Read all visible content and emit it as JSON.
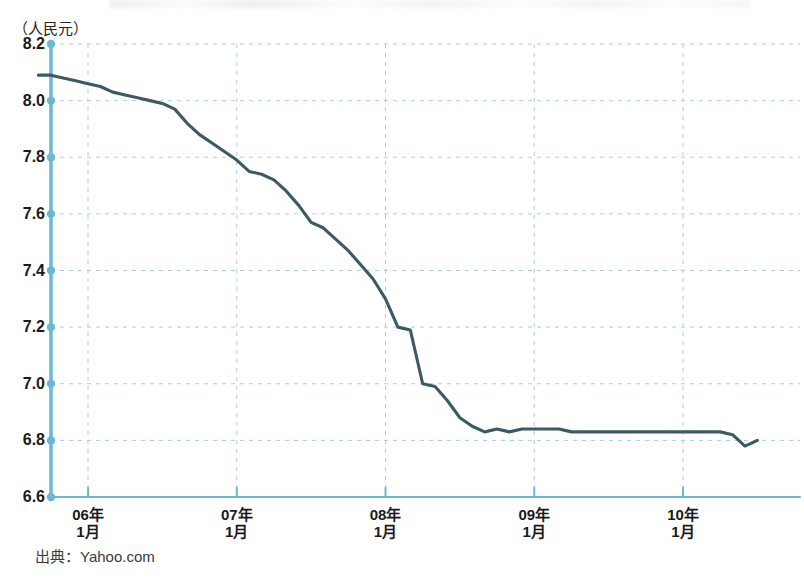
{
  "chart_data": {
    "type": "line",
    "title": "",
    "subtitle": "",
    "unit_label": "（人民元）",
    "ylabel": "人民元",
    "xlabel": "",
    "ylim": [
      6.6,
      8.2
    ],
    "y_ticks": [
      "8.2",
      "8.0",
      "7.8",
      "7.6",
      "7.4",
      "7.2",
      "7.0",
      "6.8",
      "6.6"
    ],
    "y_tick_values": [
      8.2,
      8.0,
      7.8,
      7.6,
      7.4,
      7.2,
      7.0,
      6.8,
      6.6
    ],
    "x_ticks": [
      {
        "year": "06年",
        "month": "1月"
      },
      {
        "year": "07年",
        "month": "1月"
      },
      {
        "year": "08年",
        "month": "1月"
      },
      {
        "year": "09年",
        "month": "1月"
      },
      {
        "year": "10年",
        "month": "1月"
      }
    ],
    "x_tick_labels": [
      "06年 1月",
      "07年 1月",
      "08年 1月",
      "09年 1月",
      "10年 1月"
    ],
    "xlim": [
      "2005-09",
      "2010-07"
    ],
    "grid": true,
    "legend": "none",
    "series": [
      {
        "name": "人民元相場",
        "color": "#3d5a63",
        "x": [
          "2005-09",
          "2005-10",
          "2005-11",
          "2005-12",
          "2006-01",
          "2006-02",
          "2006-03",
          "2006-04",
          "2006-05",
          "2006-06",
          "2006-07",
          "2006-08",
          "2006-09",
          "2006-10",
          "2006-11",
          "2006-12",
          "2007-01",
          "2007-02",
          "2007-03",
          "2007-04",
          "2007-05",
          "2007-06",
          "2007-07",
          "2007-08",
          "2007-09",
          "2007-10",
          "2007-11",
          "2007-12",
          "2008-01",
          "2008-02",
          "2008-03",
          "2008-04",
          "2008-05",
          "2008-06",
          "2008-07",
          "2008-08",
          "2008-09",
          "2008-10",
          "2008-11",
          "2008-12",
          "2009-01",
          "2009-02",
          "2009-03",
          "2009-04",
          "2009-05",
          "2009-06",
          "2009-07",
          "2009-08",
          "2009-09",
          "2009-10",
          "2009-11",
          "2009-12",
          "2010-01",
          "2010-02",
          "2010-03",
          "2010-04",
          "2010-05",
          "2010-06",
          "2010-07"
        ],
        "values": [
          8.09,
          8.09,
          8.08,
          8.07,
          8.06,
          8.05,
          8.03,
          8.02,
          8.01,
          8.0,
          7.99,
          7.97,
          7.92,
          7.88,
          7.85,
          7.82,
          7.79,
          7.75,
          7.74,
          7.72,
          7.68,
          7.63,
          7.57,
          7.55,
          7.51,
          7.47,
          7.42,
          7.37,
          7.3,
          7.2,
          7.19,
          7.0,
          6.99,
          6.94,
          6.88,
          6.85,
          6.83,
          6.84,
          6.83,
          6.84,
          6.84,
          6.84,
          6.84,
          6.83,
          6.83,
          6.83,
          6.83,
          6.83,
          6.83,
          6.83,
          6.83,
          6.83,
          6.83,
          6.83,
          6.83,
          6.83,
          6.82,
          6.78,
          6.8
        ]
      }
    ],
    "annotations": []
  },
  "footer": {
    "source_label": "出典：Yahoo.com"
  },
  "style": {
    "axis_color": "#6bb8d4",
    "grid_color": "#a9cfe0",
    "line_color": "#3d5a63",
    "text_color": "#1a1a1a",
    "background": "#ffffff"
  }
}
